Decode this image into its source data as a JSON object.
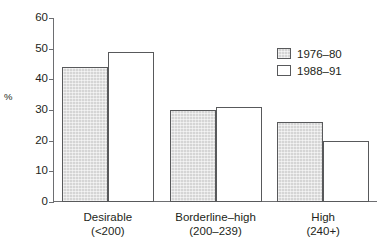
{
  "chart_data": {
    "type": "bar",
    "title": "",
    "xlabel": "",
    "ylabel": "%",
    "ylim": [
      0,
      60
    ],
    "yticks": [
      0,
      10,
      20,
      30,
      40,
      50,
      60
    ],
    "grid": false,
    "legend_position": "top-right",
    "categories": [
      "Desirable",
      "Borderline–high",
      "High"
    ],
    "category_sublabels": [
      "(<200)",
      "(200–239)",
      "(240+)"
    ],
    "series": [
      {
        "name": "1976–80",
        "values": [
          44,
          30,
          26
        ],
        "color": "#d5d5d5"
      },
      {
        "name": "1988–91",
        "values": [
          49,
          31,
          20
        ],
        "color": "#ffffff"
      }
    ]
  },
  "axis": {
    "y_title": "%",
    "tick_labels": [
      "60",
      "50",
      "40",
      "30",
      "20",
      "10",
      "0"
    ]
  },
  "legend": {
    "entries": [
      {
        "label": "1976–80"
      },
      {
        "label": "1988–91"
      }
    ]
  },
  "categories": [
    {
      "line1": "Desirable",
      "line2": "(<200)"
    },
    {
      "line1": "Borderline–high",
      "line2": "(200–239)"
    },
    {
      "line1": "High",
      "line2": "(240+)"
    }
  ]
}
